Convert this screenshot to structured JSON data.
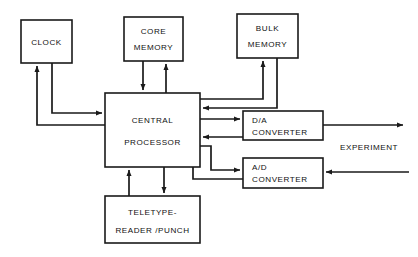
{
  "diagram": {
    "type": "block-diagram",
    "background_color": "#ffffff",
    "line_color": "#1a1a1a",
    "text_color": "#111111",
    "blocks": [
      {
        "id": "clock",
        "line1": "CLOCK",
        "line2": "",
        "x": 21,
        "y": 20,
        "w": 51,
        "h": 43,
        "align": "center"
      },
      {
        "id": "core-memory",
        "line1": "CORE",
        "line2": "MEMORY",
        "x": 124,
        "y": 17,
        "w": 59,
        "h": 44,
        "align": "center"
      },
      {
        "id": "bulk-memory",
        "line1": "BULK",
        "line2": "MEMORY",
        "x": 237,
        "y": 14,
        "w": 61,
        "h": 44,
        "align": "center"
      },
      {
        "id": "central-processor",
        "line1": "CENTRAL",
        "line2": "PROCESSOR",
        "x": 105,
        "y": 93,
        "w": 95,
        "h": 74,
        "align": "center"
      },
      {
        "id": "da-converter",
        "line1": "D/A",
        "line2": "CONVERTER",
        "x": 243,
        "y": 111,
        "w": 80,
        "h": 29,
        "align": "left"
      },
      {
        "id": "ad-converter",
        "line1": "A/D",
        "line2": "CONVERTER",
        "x": 243,
        "y": 158,
        "w": 80,
        "h": 30,
        "align": "left"
      },
      {
        "id": "teletype",
        "line1": "TELETYPE-",
        "line2": "READER /PUNCH",
        "x": 105,
        "y": 196,
        "w": 95,
        "h": 47,
        "align": "center"
      }
    ],
    "free_labels": [
      {
        "id": "experiment",
        "text": "EXPERIMENT",
        "x": 340,
        "y": 150
      }
    ],
    "connections": [
      {
        "id": "cpu-to-clock",
        "from": "central-processor",
        "to": "clock",
        "arrow": true
      },
      {
        "id": "clock-to-cpu",
        "from": "clock",
        "to": "central-processor",
        "arrow": true
      },
      {
        "id": "cpu-to-core-memory",
        "from": "central-processor",
        "to": "core-memory",
        "arrow": true
      },
      {
        "id": "core-memory-to-cpu",
        "from": "core-memory",
        "to": "central-processor",
        "arrow": true
      },
      {
        "id": "cpu-to-bulk-memory",
        "from": "central-processor",
        "to": "bulk-memory",
        "arrow": true
      },
      {
        "id": "bulk-memory-to-cpu",
        "from": "bulk-memory",
        "to": "central-processor",
        "arrow": true
      },
      {
        "id": "cpu-to-da-converter",
        "from": "central-processor",
        "to": "da-converter",
        "arrow": true
      },
      {
        "id": "da-converter-to-cpu",
        "from": "da-converter",
        "to": "central-processor",
        "arrow": true
      },
      {
        "id": "cpu-to-ad-converter",
        "from": "central-processor",
        "to": "ad-converter",
        "arrow": true
      },
      {
        "id": "ad-converter-to-cpu",
        "from": "ad-converter",
        "to": "central-processor",
        "arrow": true
      },
      {
        "id": "cpu-to-teletype",
        "from": "central-processor",
        "to": "teletype",
        "arrow": true
      },
      {
        "id": "teletype-to-cpu",
        "from": "teletype",
        "to": "central-processor",
        "arrow": true
      },
      {
        "id": "da-converter-to-experiment",
        "from": "da-converter",
        "to": "experiment",
        "arrow": true
      },
      {
        "id": "experiment-to-ad-converter",
        "from": "experiment",
        "to": "ad-converter",
        "arrow": true
      }
    ]
  }
}
